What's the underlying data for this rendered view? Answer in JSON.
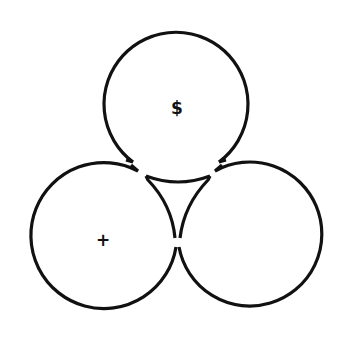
{
  "diagram": {
    "type": "three-circle-cluster",
    "colors": {
      "stroke": "#111111",
      "background": "#ffffff"
    },
    "circles": [
      {
        "id": "top",
        "cx": 177,
        "cy": 105,
        "r": 72,
        "symbol": "$"
      },
      {
        "id": "bottom-left",
        "cx": 102,
        "cy": 240,
        "r": 73,
        "symbol": "+"
      },
      {
        "id": "bottom-right",
        "cx": 251,
        "cy": 240,
        "r": 72,
        "symbol": ""
      }
    ],
    "labels": {
      "top_symbol": "$",
      "left_symbol": "+"
    }
  }
}
